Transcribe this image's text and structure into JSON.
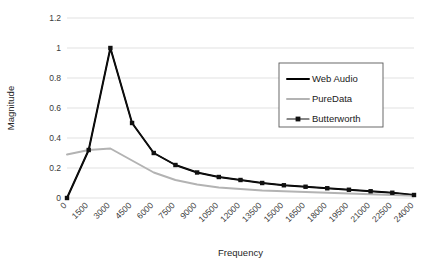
{
  "chart_data": {
    "type": "line",
    "title": "",
    "xlabel": "Frequency",
    "ylabel": "Magnitude",
    "xlim": [
      0,
      24000
    ],
    "ylim": [
      0,
      1.2
    ],
    "ygrid": true,
    "xgrid": false,
    "legend_position": "upper-right-inside",
    "ytick_labels": [
      "0",
      "0.2",
      "0.4",
      "0.6",
      "0.8",
      "1",
      "1.2"
    ],
    "ytick_values": [
      0,
      0.2,
      0.4,
      0.6,
      0.8,
      1,
      1.2
    ],
    "xtick_labels": [
      "0",
      "1500",
      "3000",
      "4500",
      "6000",
      "7500",
      "9000",
      "10500",
      "12000",
      "13500",
      "15000",
      "16500",
      "18000",
      "19500",
      "21000",
      "22500",
      "24000"
    ],
    "x": [
      0,
      1500,
      3000,
      4500,
      6000,
      7500,
      9000,
      10500,
      12000,
      13500,
      15000,
      16500,
      18000,
      19500,
      21000,
      22500,
      24000
    ],
    "series": [
      {
        "name": "Web Audio",
        "color": "#000000",
        "marker": "none",
        "values": [
          0,
          0.32,
          1.0,
          0.5,
          0.3,
          0.22,
          0.17,
          0.14,
          0.12,
          0.1,
          0.085,
          0.075,
          0.065,
          0.055,
          0.045,
          0.035,
          0.02
        ]
      },
      {
        "name": "PureData",
        "color": "#b3b3b3",
        "marker": "none",
        "values": [
          0.29,
          0.32,
          0.33,
          0.25,
          0.17,
          0.12,
          0.09,
          0.07,
          0.06,
          0.05,
          0.045,
          0.04,
          0.035,
          0.03,
          0.025,
          0.02,
          0.015
        ]
      },
      {
        "name": "Butterworth",
        "color": "#111111",
        "marker": "square",
        "values": [
          0,
          0.32,
          1.0,
          0.5,
          0.3,
          0.22,
          0.17,
          0.14,
          0.12,
          0.1,
          0.085,
          0.075,
          0.065,
          0.055,
          0.045,
          0.035,
          0.02
        ]
      }
    ]
  },
  "legend": {
    "items": [
      {
        "label": "Web Audio"
      },
      {
        "label": "PureData"
      },
      {
        "label": "Butterworth"
      }
    ]
  },
  "axes": {
    "x_title": "Frequency",
    "y_title": "Magnitude"
  }
}
